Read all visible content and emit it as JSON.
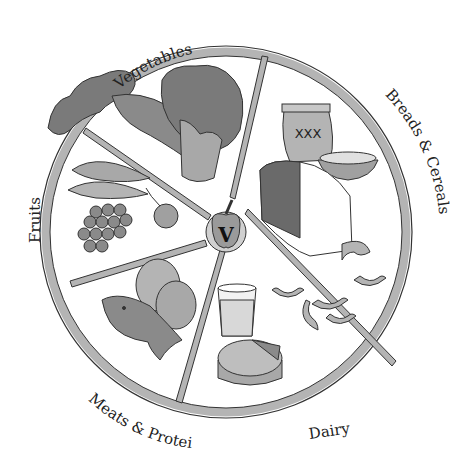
{
  "center": {
    "letter": "V",
    "icon": "apple-icon"
  },
  "groups": [
    {
      "label": "Vegetables",
      "icon": "vegetables-icon",
      "items": [
        "kale",
        "carrots",
        "broccoli"
      ]
    },
    {
      "label": "Breads & Cereals",
      "icon": "breads-cereals-icon",
      "items": [
        "flour bag XXX",
        "bread loaf",
        "cereal bowl",
        "macaroni"
      ]
    },
    {
      "label": "Dairy",
      "icon": "dairy-icon",
      "items": [
        "glass of milk",
        "cheese wheel"
      ]
    },
    {
      "label": "Meats & Proteins",
      "icon": "meats-proteins-icon",
      "items": [
        "fish",
        "eggs"
      ]
    },
    {
      "label": "Fruits",
      "icon": "fruits-icon",
      "items": [
        "bananas",
        "grapes",
        "cherries"
      ]
    }
  ],
  "bag_text": "XXX",
  "colors": {
    "ring": "#b4b4b4",
    "outline": "#333333",
    "fill_dark": "#7a7a7a",
    "fill_mid": "#a8a8a8",
    "fill_light": "#c8c8c8"
  }
}
